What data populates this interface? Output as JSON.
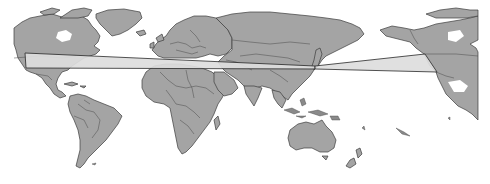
{
  "map": {
    "type": "world-map",
    "projection": "equirectangular",
    "center": "Pacific-Atlantic (Greenwich near middle-left)",
    "colors": {
      "background": "#ffffff",
      "land": "#a4a4a4",
      "outline": "#3c3c3c",
      "route_fill": "#dedede",
      "route_stroke": "#2e2e2e"
    },
    "regions_visible": [
      "North America",
      "Greenland",
      "South America",
      "Europe",
      "Africa",
      "Asia",
      "Japan",
      "Australia",
      "New Zealand",
      "Alaska",
      "Central America",
      "Caribbean"
    ],
    "overlays": [
      {
        "name": "route-wedge-west",
        "description": "Light-gray wedge spanning from western North America across the Atlantic, Europe and Asia converging near Japan",
        "points": [
          [
            25,
            53
          ],
          [
            315,
            66
          ],
          [
            315,
            69
          ],
          [
            26,
            68
          ]
        ]
      },
      {
        "name": "route-wedge-east",
        "description": "Light-gray wedge from Japan across the Pacific diverging to the North American west coast",
        "points": [
          [
            315,
            66
          ],
          [
            425,
            54
          ],
          [
            437,
            72
          ],
          [
            315,
            69
          ]
        ]
      }
    ],
    "labels": []
  }
}
